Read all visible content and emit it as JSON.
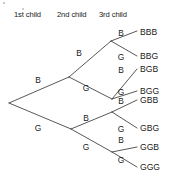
{
  "figure": {
    "name": "probability-tree-three-children",
    "background_color": "#ffffff",
    "line_color": "#3a3a3a",
    "text_color": "#1a1a1a"
  },
  "headers": [
    {
      "id": "col1",
      "label": "1st child",
      "x": 14,
      "y": 17
    },
    {
      "id": "col2",
      "label": "2nd child",
      "x": 57,
      "y": 17
    },
    {
      "id": "col3",
      "label": "3rd child",
      "x": 99,
      "y": 17
    }
  ],
  "root": {
    "x": 9,
    "y": 103
  },
  "branch_labels": [
    {
      "id": "l1-b",
      "label": "B",
      "x": 38,
      "y": 83
    },
    {
      "id": "l1-g",
      "label": "G",
      "x": 38,
      "y": 131
    },
    {
      "id": "l2-bb",
      "label": "B",
      "x": 79,
      "y": 56
    },
    {
      "id": "l2-bg",
      "label": "G",
      "x": 86,
      "y": 91
    },
    {
      "id": "l2-gb",
      "label": "B",
      "x": 86,
      "y": 121
    },
    {
      "id": "l2-gg",
      "label": "G",
      "x": 86,
      "y": 150
    },
    {
      "id": "l3-bbb",
      "label": "B",
      "x": 121,
      "y": 36
    },
    {
      "id": "l3-bbg",
      "label": "G",
      "x": 121,
      "y": 60
    },
    {
      "id": "l3-bgb",
      "label": "B",
      "x": 121,
      "y": 73
    },
    {
      "id": "l3-bgg",
      "label": "G",
      "x": 121,
      "y": 95
    },
    {
      "id": "l3-gbb",
      "label": "B",
      "x": 121,
      "y": 104
    },
    {
      "id": "l3-gbg",
      "label": "G",
      "x": 121,
      "y": 132
    },
    {
      "id": "l3-ggb",
      "label": "B",
      "x": 121,
      "y": 143
    },
    {
      "id": "l3-ggg",
      "label": "G",
      "x": 121,
      "y": 163
    }
  ],
  "outcomes": [
    {
      "id": "outcome-bbb",
      "label": "BBB",
      "x": 140,
      "y": 35
    },
    {
      "id": "outcome-bbg",
      "label": "BBG",
      "x": 140,
      "y": 59
    },
    {
      "id": "outcome-bgb",
      "label": "BGB",
      "x": 140,
      "y": 72
    },
    {
      "id": "outcome-bgg",
      "label": "BGG",
      "x": 140,
      "y": 94
    },
    {
      "id": "outcome-gbb",
      "label": "GBB",
      "x": 140,
      "y": 103
    },
    {
      "id": "outcome-gbg",
      "label": "GBG",
      "x": 140,
      "y": 131
    },
    {
      "id": "outcome-ggb",
      "label": "GGB",
      "x": 140,
      "y": 150
    },
    {
      "id": "outcome-ggg",
      "label": "GGG",
      "x": 140,
      "y": 170
    }
  ],
  "edges": [
    {
      "id": "edge-root-b",
      "x1": 9,
      "y1": 103,
      "x2": 69,
      "y2": 77
    },
    {
      "id": "edge-root-g",
      "x1": 9,
      "y1": 103,
      "x2": 71,
      "y2": 129
    },
    {
      "id": "edge-b-bb",
      "x1": 69,
      "y1": 77,
      "x2": 111,
      "y2": 41
    },
    {
      "id": "edge-b-bg",
      "x1": 69,
      "y1": 77,
      "x2": 112,
      "y2": 99
    },
    {
      "id": "edge-g-gb",
      "x1": 71,
      "y1": 129,
      "x2": 112,
      "y2": 112
    },
    {
      "id": "edge-g-gg",
      "x1": 71,
      "y1": 129,
      "x2": 112,
      "y2": 152
    },
    {
      "id": "edge-bb-bbb",
      "x1": 111,
      "y1": 41,
      "x2": 137,
      "y2": 31
    },
    {
      "id": "edge-bb-bbg",
      "x1": 111,
      "y1": 41,
      "x2": 137,
      "y2": 56
    },
    {
      "id": "edge-bg-bgb",
      "x1": 112,
      "y1": 99,
      "x2": 137,
      "y2": 69
    },
    {
      "id": "edge-bg-bgg",
      "x1": 112,
      "y1": 99,
      "x2": 137,
      "y2": 91
    },
    {
      "id": "edge-gb-gbb",
      "x1": 112,
      "y1": 112,
      "x2": 137,
      "y2": 100
    },
    {
      "id": "edge-gb-gbg",
      "x1": 112,
      "y1": 112,
      "x2": 137,
      "y2": 128
    },
    {
      "id": "edge-gg-ggb",
      "x1": 112,
      "y1": 152,
      "x2": 137,
      "y2": 147
    },
    {
      "id": "edge-gg-ggg",
      "x1": 112,
      "y1": 152,
      "x2": 137,
      "y2": 167
    }
  ],
  "specks": [
    {
      "x": 4,
      "y": 3,
      "r": 1.1
    },
    {
      "x": 23,
      "y": 9,
      "r": 0.9
    }
  ]
}
